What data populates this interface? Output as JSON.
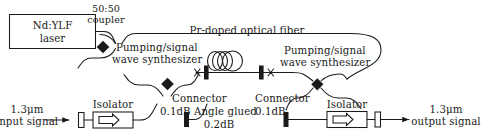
{
  "figure": {
    "width": 484,
    "height": 139,
    "line_color": "#1a1a1a",
    "text_color": "#1a1a1a",
    "background": "#ffffff"
  },
  "labels": {
    "laser_line1": "Nd:YLF",
    "laser_line2": "laser",
    "coupler_line1": "50:50",
    "coupler_line2": "coupler",
    "fiber": "Pr-doped optical fiber",
    "synth_left_line1": "Pumping/signal",
    "synth_left_line2": "wave synthesizer",
    "synth_right_line1": "Pumping/signal",
    "synth_right_line2": "wave synthesizer",
    "input_line1": "1.3μm",
    "input_line2": "input signal",
    "output_line1": "1.3μm",
    "output_line2": "output signal",
    "isolator_left": "Isolator",
    "isolator_right": "Isolator",
    "connector_left_line1": "Connector",
    "connector_left_line2": "0.1dB",
    "connector_right_line1": "Connector",
    "connector_right_line2": "0.1dB",
    "angle_glued_line1": "Angle glued",
    "angle_glued_line2": "0.2dB"
  },
  "components": {
    "laser_box": "nd-ylf-laser-box",
    "coupler_5050": "50-50-coupler-node",
    "synthesizer_left": "left-wave-synthesizer-node",
    "synthesizer_right": "right-wave-synthesizer-node",
    "fiber_coil": "pr-doped-fiber-coil",
    "splice_left": "angle-glued-splice-left",
    "splice_right": "angle-glued-splice-right",
    "isolator_left": "input-isolator",
    "isolator_right": "output-isolator",
    "connector_left": "input-connector",
    "connector_right": "output-connector",
    "connector_fiber_left": "fiber-connector-left",
    "connector_fiber_right": "fiber-connector-right",
    "input_arrow": "input-signal-arrow",
    "output_arrow": "output-signal-arrow"
  }
}
